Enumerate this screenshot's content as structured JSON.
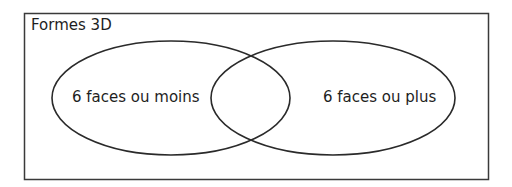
{
  "diagram": {
    "type": "venn",
    "title": "Formes 3D",
    "sets": [
      {
        "label": "6 faces ou moins"
      },
      {
        "label": "6 faces ou plus"
      }
    ],
    "colors": {
      "stroke": "#2a2a2a",
      "text": "#1e1e1e",
      "background": "#ffffff"
    }
  }
}
